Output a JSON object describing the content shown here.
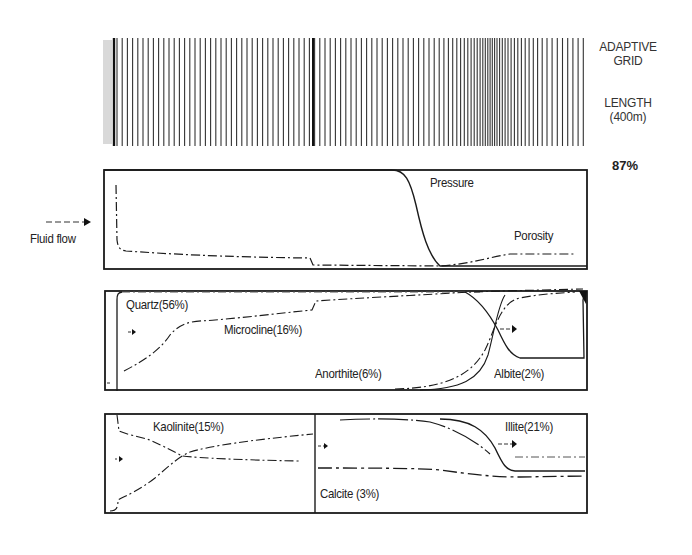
{
  "chart_data": [
    {
      "type": "grid",
      "title": "Adaptive grid",
      "labels": {
        "grid": "ADAPTIVE GRID",
        "length": "LENGTH (400m)",
        "refinement_pct": "87%"
      },
      "x_range_px": [
        103,
        585
      ],
      "note": "Vertical grid lines, ~5px spacing, densifying around the pressure front (~x=480-500)"
    },
    {
      "type": "line",
      "title": "Pressure / Porosity",
      "xlabel": "Length (400 m)",
      "flow_label": "Fluid flow",
      "series": [
        {
          "name": "Pressure",
          "style": "solid",
          "x": [
            0,
            0.55,
            0.6,
            0.63,
            0.66,
            0.69,
            1.0
          ],
          "y": [
            1.0,
            1.0,
            0.95,
            0.6,
            0.15,
            0.0,
            0.0
          ]
        },
        {
          "name": "Porosity",
          "style": "dashdot",
          "x": [
            0.03,
            0.035,
            0.05,
            0.25,
            0.43,
            0.44,
            0.69,
            0.78,
            0.85,
            1.0
          ],
          "y": [
            0.85,
            0.2,
            0.13,
            0.1,
            0.1,
            0.03,
            0.03,
            0.1,
            0.14,
            0.14
          ]
        }
      ]
    },
    {
      "type": "line",
      "title": "Primary minerals",
      "series": [
        {
          "name": "Quartz(56%)",
          "style": "dashdot",
          "x": [
            0.03,
            0.45,
            1.0
          ],
          "y": [
            0.98,
            0.99,
            0.99
          ]
        },
        {
          "name": "Microcline(16%)",
          "style": "dashdot",
          "x": [
            0.03,
            0.12,
            0.22,
            0.3,
            0.43,
            0.44,
            0.6,
            0.75,
            0.82,
            1.0
          ],
          "y": [
            0.05,
            0.3,
            0.55,
            0.65,
            0.71,
            0.8,
            0.85,
            0.9,
            0.95,
            0.97
          ]
        },
        {
          "name": "Anorthite(6%)",
          "style": "dashdot",
          "x": [
            0.42,
            0.6,
            0.72,
            0.8,
            0.83
          ],
          "y": [
            0.0,
            0.02,
            0.15,
            0.6,
            0.97
          ]
        },
        {
          "name": "Albite(2%)",
          "style": "solid",
          "x": [
            0.55,
            0.72,
            0.8,
            0.84,
            0.86,
            0.9,
            1.0
          ],
          "y": [
            0.98,
            0.9,
            0.6,
            0.25,
            0.1,
            0.08,
            0.08
          ]
        }
      ]
    },
    {
      "type": "line",
      "title": "Secondary minerals",
      "series": [
        {
          "name": "Kaolinite(15%)",
          "style": "dashdot",
          "x": [
            0.0,
            0.02,
            0.1,
            0.25,
            0.43
          ],
          "y": [
            0.95,
            0.75,
            0.65,
            0.45,
            0.45
          ]
        },
        {
          "name": "Kaolinite-b",
          "style": "dashdot",
          "x": [
            0.0,
            0.02,
            0.1,
            0.25,
            0.43
          ],
          "y": [
            0.05,
            0.15,
            0.3,
            0.6,
            0.8
          ]
        },
        {
          "name": "Illite(21%)",
          "style": "solid",
          "x": [
            0.6,
            0.75,
            0.82,
            0.87,
            1.0
          ],
          "y": [
            0.95,
            0.8,
            0.6,
            0.35,
            0.35
          ]
        },
        {
          "name": "Calcite (3%)",
          "style": "dashdot",
          "x": [
            0.44,
            0.6,
            0.75,
            0.85,
            1.0
          ],
          "y": [
            0.37,
            0.37,
            0.3,
            0.26,
            0.27
          ]
        }
      ]
    }
  ],
  "labels": {
    "adaptive_grid": "ADAPTIVE\nGRID",
    "adaptive_line1": "ADAPTIVE",
    "adaptive_line2": "GRID",
    "length_line1": "LENGTH",
    "length_line2": "(400m)",
    "percent": "87%",
    "fluid_flow": "Fluid flow",
    "pressure": "Pressure",
    "porosity": "Porosity",
    "quartz": "Quartz(56%)",
    "microcline": "Microcline(16%)",
    "anorthite": "Anorthite(6%)",
    "albite": "Albite(2%)",
    "kaolinite": "Kaolinite(15%)",
    "illite": "Illite(21%)",
    "calcite": "Calcite (3%)"
  },
  "colors": {
    "ink": "#1a1a1a",
    "grid": "#3a3a3a",
    "background": "#ffffff"
  }
}
